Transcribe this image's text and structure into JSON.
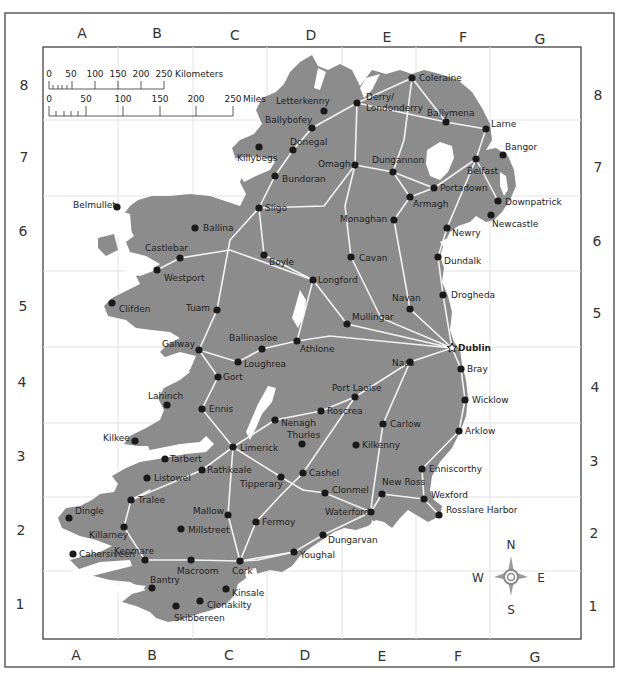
{
  "colors": {
    "land": "#8c8c8c",
    "water": "#ffffff",
    "road": "#f2f2f2",
    "city_dot": "#1a1a1a",
    "grid": "#e4e4e4",
    "frame": "#333333"
  },
  "grid": {
    "columns": [
      "A",
      "B",
      "C",
      "D",
      "E",
      "F",
      "G"
    ],
    "rows": [
      "8",
      "7",
      "6",
      "5",
      "4",
      "3",
      "2",
      "1"
    ]
  },
  "scale_bar": {
    "kilometers": {
      "ticks": [
        "0",
        "50",
        "100",
        "150",
        "200",
        "250"
      ],
      "unit": "Kilometers"
    },
    "miles": {
      "ticks": [
        "0",
        "50",
        "100",
        "150",
        "200",
        "250"
      ],
      "unit": "Miles"
    }
  },
  "compass": {
    "n": "N",
    "s": "S",
    "e": "E",
    "w": "W"
  },
  "capital": {
    "name": "Dublin",
    "x": 452,
    "y": 348,
    "lx": 458,
    "ly": 351
  },
  "cities": [
    {
      "name": "Coleraine",
      "x": 412,
      "y": 78,
      "lx": 419,
      "ly": 81
    },
    {
      "name": "Derry/",
      "x": 357,
      "y": 103,
      "lx": 366,
      "ly": 100
    },
    {
      "name": "Londonderry",
      "x": 357,
      "y": 103,
      "lx": 366,
      "ly": 111
    },
    {
      "name": "Letterkenny",
      "x": 324,
      "y": 111,
      "lx": 276,
      "ly": 104
    },
    {
      "name": "Ballybofey",
      "x": 312,
      "y": 128,
      "lx": 265,
      "ly": 123
    },
    {
      "name": "Ballymena",
      "x": 446,
      "y": 122,
      "lx": 427,
      "ly": 116
    },
    {
      "name": "Larne",
      "x": 486,
      "y": 129,
      "lx": 491,
      "ly": 127
    },
    {
      "name": "Donegal",
      "x": 293,
      "y": 150,
      "lx": 290,
      "ly": 145
    },
    {
      "name": "Killybegs",
      "x": 259,
      "y": 147,
      "lx": 237,
      "ly": 161
    },
    {
      "name": "Omagh",
      "x": 355,
      "y": 165,
      "lx": 318,
      "ly": 167
    },
    {
      "name": "Dungannon",
      "x": 393,
      "y": 172,
      "lx": 372,
      "ly": 163
    },
    {
      "name": "Bangor",
      "x": 503,
      "y": 155,
      "lx": 505,
      "ly": 150
    },
    {
      "name": "Belfast",
      "x": 476,
      "y": 159,
      "lx": 467,
      "ly": 174
    },
    {
      "name": "Bundoran",
      "x": 275,
      "y": 176,
      "lx": 282,
      "ly": 182
    },
    {
      "name": "Portadown",
      "x": 434,
      "y": 188,
      "lx": 440,
      "ly": 191
    },
    {
      "name": "Armagh",
      "x": 410,
      "y": 197,
      "lx": 413,
      "ly": 207
    },
    {
      "name": "Downpatrick",
      "x": 498,
      "y": 201,
      "lx": 505,
      "ly": 205
    },
    {
      "name": "Belmullet",
      "x": 117,
      "y": 207,
      "lx": 73,
      "ly": 208
    },
    {
      "name": "Sligo",
      "x": 259,
      "y": 208,
      "lx": 265,
      "ly": 211
    },
    {
      "name": "Newcastle",
      "x": 491,
      "y": 215,
      "lx": 492,
      "ly": 227
    },
    {
      "name": "Monaghan",
      "x": 394,
      "y": 220,
      "lx": 340,
      "ly": 222
    },
    {
      "name": "Ballina",
      "x": 195,
      "y": 228,
      "lx": 203,
      "ly": 231
    },
    {
      "name": "Newry",
      "x": 447,
      "y": 228,
      "lx": 452,
      "ly": 236
    },
    {
      "name": "Castlebar",
      "x": 180,
      "y": 258,
      "lx": 145,
      "ly": 251
    },
    {
      "name": "Cavan",
      "x": 351,
      "y": 257,
      "lx": 359,
      "ly": 261
    },
    {
      "name": "Boyle",
      "x": 264,
      "y": 255,
      "lx": 269,
      "ly": 265
    },
    {
      "name": "Dundalk",
      "x": 438,
      "y": 257,
      "lx": 444,
      "ly": 264
    },
    {
      "name": "Westport",
      "x": 157,
      "y": 270,
      "lx": 164,
      "ly": 281
    },
    {
      "name": "Longford",
      "x": 313,
      "y": 280,
      "lx": 318,
      "ly": 283
    },
    {
      "name": "Drogheda",
      "x": 443,
      "y": 295,
      "lx": 451,
      "ly": 298
    },
    {
      "name": "Clifden",
      "x": 112,
      "y": 303,
      "lx": 119,
      "ly": 312
    },
    {
      "name": "Tuam",
      "x": 217,
      "y": 310,
      "lx": 186,
      "ly": 311
    },
    {
      "name": "Navan",
      "x": 410,
      "y": 309,
      "lx": 392,
      "ly": 301
    },
    {
      "name": "Mullingar",
      "x": 347,
      "y": 324,
      "lx": 352,
      "ly": 320
    },
    {
      "name": "Athlone",
      "x": 297,
      "y": 341,
      "lx": 300,
      "ly": 352
    },
    {
      "name": "Ballinasloe",
      "x": 262,
      "y": 349,
      "lx": 229,
      "ly": 341
    },
    {
      "name": "Galway",
      "x": 199,
      "y": 350,
      "lx": 162,
      "ly": 347
    },
    {
      "name": "Loughrea",
      "x": 238,
      "y": 362,
      "lx": 244,
      "ly": 367
    },
    {
      "name": "Bray",
      "x": 461,
      "y": 369,
      "lx": 467,
      "ly": 372
    },
    {
      "name": "Naas",
      "x": 410,
      "y": 362,
      "lx": 392,
      "ly": 366
    },
    {
      "name": "Gort",
      "x": 218,
      "y": 377,
      "lx": 223,
      "ly": 380
    },
    {
      "name": "Port Laoise",
      "x": 355,
      "y": 397,
      "lx": 332,
      "ly": 391
    },
    {
      "name": "Lahinch",
      "x": 167,
      "y": 405,
      "lx": 148,
      "ly": 399
    },
    {
      "name": "Wicklow",
      "x": 465,
      "y": 400,
      "lx": 472,
      "ly": 403
    },
    {
      "name": "Ennis",
      "x": 202,
      "y": 409,
      "lx": 209,
      "ly": 412
    },
    {
      "name": "Roscrea",
      "x": 321,
      "y": 411,
      "lx": 327,
      "ly": 414
    },
    {
      "name": "Nenagh",
      "x": 275,
      "y": 420,
      "lx": 281,
      "ly": 426
    },
    {
      "name": "Carlow",
      "x": 383,
      "y": 424,
      "lx": 390,
      "ly": 427
    },
    {
      "name": "Thurles",
      "x": 302,
      "y": 444,
      "lx": 287,
      "ly": 438
    },
    {
      "name": "Kilkee",
      "x": 135,
      "y": 441,
      "lx": 103,
      "ly": 441
    },
    {
      "name": "Kilkenny",
      "x": 356,
      "y": 445,
      "lx": 362,
      "ly": 448
    },
    {
      "name": "Arklow",
      "x": 459,
      "y": 431,
      "lx": 465,
      "ly": 434
    },
    {
      "name": "Limerick",
      "x": 233,
      "y": 447,
      "lx": 240,
      "ly": 451
    },
    {
      "name": "Tarbert",
      "x": 165,
      "y": 459,
      "lx": 170,
      "ly": 462
    },
    {
      "name": "Rathkeale",
      "x": 202,
      "y": 470,
      "lx": 207,
      "ly": 473
    },
    {
      "name": "Listowel",
      "x": 147,
      "y": 478,
      "lx": 154,
      "ly": 481
    },
    {
      "name": "Cashel",
      "x": 303,
      "y": 473,
      "lx": 309,
      "ly": 476
    },
    {
      "name": "Tipperary",
      "x": 281,
      "y": 477,
      "lx": 240,
      "ly": 487
    },
    {
      "name": "Enniscorthy",
      "x": 422,
      "y": 469,
      "lx": 429,
      "ly": 472
    },
    {
      "name": "Clonmel",
      "x": 325,
      "y": 493,
      "lx": 332,
      "ly": 493
    },
    {
      "name": "New Ross",
      "x": 382,
      "y": 494,
      "lx": 382,
      "ly": 485
    },
    {
      "name": "Wexford",
      "x": 424,
      "y": 499,
      "lx": 431,
      "ly": 498
    },
    {
      "name": "Tralee",
      "x": 131,
      "y": 500,
      "lx": 138,
      "ly": 503
    },
    {
      "name": "Waterford",
      "x": 371,
      "y": 512,
      "lx": 325,
      "ly": 515
    },
    {
      "name": "Rosslare Harbor",
      "x": 439,
      "y": 515,
      "lx": 446,
      "ly": 513
    },
    {
      "name": "Dingle",
      "x": 69,
      "y": 518,
      "lx": 75,
      "ly": 514
    },
    {
      "name": "Mallow",
      "x": 228,
      "y": 515,
      "lx": 193,
      "ly": 514
    },
    {
      "name": "Fermoy",
      "x": 256,
      "y": 522,
      "lx": 262,
      "ly": 525
    },
    {
      "name": "Killarney",
      "x": 124,
      "y": 527,
      "lx": 89,
      "ly": 538
    },
    {
      "name": "Millstreet",
      "x": 181,
      "y": 529,
      "lx": 188,
      "ly": 533
    },
    {
      "name": "Dungarvan",
      "x": 323,
      "y": 535,
      "lx": 328,
      "ly": 543
    },
    {
      "name": "Cahersiveen",
      "x": 73,
      "y": 554,
      "lx": 79,
      "ly": 557
    },
    {
      "name": "Youghal",
      "x": 294,
      "y": 552,
      "lx": 300,
      "ly": 558
    },
    {
      "name": "Kenmare",
      "x": 145,
      "y": 560,
      "lx": 114,
      "ly": 554
    },
    {
      "name": "Macroom",
      "x": 191,
      "y": 560,
      "lx": 177,
      "ly": 574
    },
    {
      "name": "Cork",
      "x": 240,
      "y": 561,
      "lx": 232,
      "ly": 574
    },
    {
      "name": "Bantry",
      "x": 152,
      "y": 588,
      "lx": 150,
      "ly": 583
    },
    {
      "name": "Kinsale",
      "x": 226,
      "y": 589,
      "lx": 232,
      "ly": 596
    },
    {
      "name": "Clonakilty",
      "x": 200,
      "y": 601,
      "lx": 207,
      "ly": 608
    },
    {
      "name": "Skibbereen",
      "x": 176,
      "y": 606,
      "lx": 174,
      "ly": 621
    }
  ]
}
